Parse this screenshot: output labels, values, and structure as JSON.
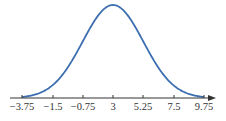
{
  "chart_data": {
    "type": "line",
    "title": "",
    "xlabel": "",
    "ylabel": "",
    "mean": 3,
    "std": 2.25,
    "tick_labels": [
      "−3.75",
      "−1.5",
      "−0.75",
      "3",
      "5.25",
      "7.5",
      "9.75"
    ],
    "tick_values": [
      -3.75,
      -1.5,
      0.75,
      3,
      5.25,
      7.5,
      9.75
    ],
    "xlim": [
      -4.4,
      10.5
    ],
    "grid": false,
    "legend": "none",
    "curve_color": "#3d6fb0",
    "axis_color": "#333333"
  }
}
